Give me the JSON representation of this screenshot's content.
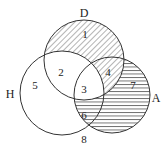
{
  "diagram": {
    "type": "venn",
    "sets": [
      {
        "id": "D",
        "label": "D",
        "cx": 84,
        "cy": 60,
        "r": 40,
        "label_x": 84,
        "label_y": 17
      },
      {
        "id": "H",
        "label": "H",
        "cx": 62,
        "cy": 93,
        "r": 42,
        "label_x": 10,
        "label_y": 98
      },
      {
        "id": "A",
        "label": "A",
        "cx": 112,
        "cy": 95,
        "r": 38,
        "label_x": 156,
        "label_y": 102
      }
    ],
    "regions": [
      {
        "id": "1",
        "label": "1",
        "x": 85,
        "y": 38,
        "hatch": "diagonal"
      },
      {
        "id": "2",
        "label": "2",
        "x": 61,
        "y": 76,
        "hatch": "none"
      },
      {
        "id": "3",
        "label": "3",
        "x": 84,
        "y": 93,
        "hatch": "none"
      },
      {
        "id": "4",
        "label": "4",
        "x": 108,
        "y": 76,
        "hatch": "diagonal"
      },
      {
        "id": "5",
        "label": "5",
        "x": 35,
        "y": 89,
        "hatch": "none"
      },
      {
        "id": "6",
        "label": "6",
        "x": 84,
        "y": 119,
        "hatch": "horizontal"
      },
      {
        "id": "7",
        "label": "7",
        "x": 133,
        "y": 89,
        "hatch": "horizontal"
      },
      {
        "id": "8",
        "label": "8",
        "x": 84,
        "y": 143,
        "hatch": "none"
      }
    ],
    "colors": {
      "stroke": "#333333",
      "hatch": "#444444",
      "background": "#ffffff"
    }
  }
}
